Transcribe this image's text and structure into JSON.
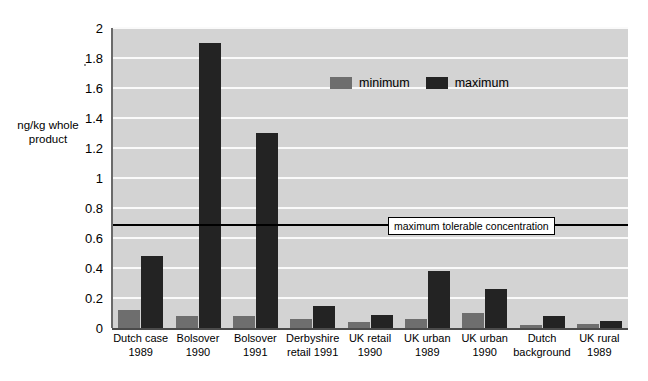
{
  "chart_data": {
    "type": "bar",
    "title": "",
    "subtitle": "",
    "xlabel": "",
    "ylabel": "ng/kg whole product",
    "ylim": [
      0,
      2
    ],
    "ytick_step": 0.2,
    "yticks": [
      "2",
      "1.8",
      "1.6",
      "1.4",
      "1.2",
      "1",
      "0.8",
      "0.6",
      "0.4",
      "0.2",
      "0"
    ],
    "ytick_values": [
      2,
      1.8,
      1.6,
      1.4,
      1.2,
      1,
      0.8,
      0.6,
      0.4,
      0.2,
      0
    ],
    "grid": true,
    "grid_axis": "y",
    "legend_position": "upper-center",
    "categories": [
      "Dutch case 1989",
      "Bolsover 1990",
      "Bolsover 1991",
      "Derbyshire retail 1991",
      "UK retail 1990",
      "UK urban 1989",
      "UK urban 1990",
      "Dutch background",
      "UK rural 1989"
    ],
    "category_lines": [
      [
        "Dutch case",
        "1989"
      ],
      [
        "Bolsover",
        "1990"
      ],
      [
        "Bolsover",
        "1991"
      ],
      [
        "Derbyshire",
        "retail 1991"
      ],
      [
        "UK retail",
        "1990"
      ],
      [
        "UK urban",
        "1989"
      ],
      [
        "UK urban",
        "1990"
      ],
      [
        "Dutch",
        "background"
      ],
      [
        "UK rural",
        "1989"
      ]
    ],
    "series": [
      {
        "name": "minimum",
        "color": "#6e6e6e",
        "values": [
          0.12,
          0.08,
          0.08,
          0.06,
          0.04,
          0.06,
          0.1,
          0.02,
          0.03
        ]
      },
      {
        "name": "maximum",
        "color": "#232323",
        "values": [
          0.48,
          1.9,
          1.3,
          0.15,
          0.09,
          0.38,
          0.26,
          0.08,
          0.05
        ]
      }
    ],
    "annotations": [
      {
        "name": "maximum-tolerable-concentration",
        "text": "maximum tolerable concentration",
        "type": "horizontal-line",
        "value": 0.69
      }
    ],
    "plot_background": "#d3d3d3",
    "gridline_color": "#fafafa"
  },
  "legend": {
    "items": [
      {
        "label": "minimum",
        "color": "#6e6e6e"
      },
      {
        "label": "maximum",
        "color": "#232323"
      }
    ]
  },
  "axis": {
    "y_title_line1": "ng/kg whole",
    "y_title_line2": "product"
  }
}
